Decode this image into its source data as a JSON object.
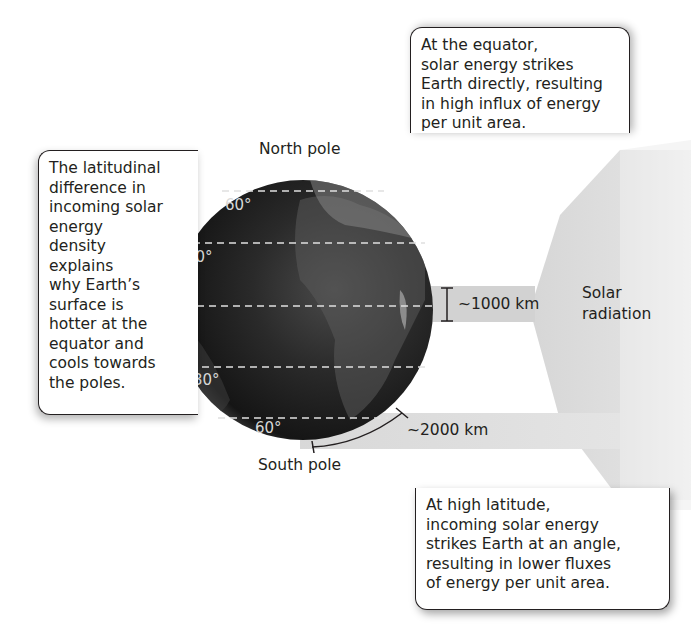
{
  "top_cutoff_text": "",
  "globe": {
    "north_label": "North pole",
    "south_label": "South pole",
    "latitudes": [
      {
        "label": "60°",
        "hemisphere": "north"
      },
      {
        "label": "30°",
        "hemisphere": "north"
      },
      {
        "label": "0°",
        "hemisphere": "equator"
      },
      {
        "label": "30°",
        "hemisphere": "south"
      },
      {
        "label": "60°",
        "hemisphere": "south"
      }
    ]
  },
  "radiation": {
    "label_line1": "Solar",
    "label_line2": "radiation",
    "equator_beam_width": "~1000 km",
    "high_latitude_beam_width": "~2000 km"
  },
  "callouts": {
    "top": {
      "lines": [
        "At the equator,",
        "solar energy strikes",
        "Earth directly, resulting",
        "in high influx of energy",
        "per unit area."
      ]
    },
    "left": {
      "lines": [
        "The latitudinal",
        "difference in",
        "incoming solar",
        "energy",
        "density",
        "explains",
        "why Earth’s",
        "surface is",
        "hotter at the",
        "equator and",
        "cools towards",
        "the poles."
      ]
    },
    "bottom": {
      "lines": [
        "At high latitude,",
        "incoming solar energy",
        "strikes Earth at an angle,",
        "resulting in lower fluxes",
        "of energy per unit area."
      ]
    }
  },
  "colors": {
    "beam_gray": "#d6d6d6",
    "globe_dark": "#1a1a1a",
    "text": "#231f20"
  }
}
